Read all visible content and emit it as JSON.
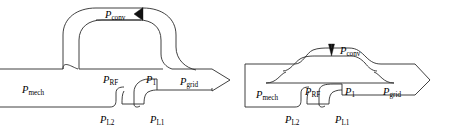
{
  "figure": {
    "kind": "power-flow-sankey-pair",
    "background_color": "#ffffff",
    "stroke_color": "#2b2b2b",
    "text_color": "#000000",
    "width": 474,
    "height": 135
  },
  "labels": {
    "p_conv_main": "P",
    "p_conv_sub": "conv",
    "p_rf_main": "P",
    "p_rf_sub": "RF",
    "p1_main": "P",
    "p1_sub": "1",
    "p_grid_main": "P",
    "p_grid_sub": "grid",
    "p_mech_main": "P",
    "p_mech_sub": "mech",
    "p_l1_main": "P",
    "p_l1_sub": "L1",
    "p_l2_main": "P",
    "p_l2_sub": "L2"
  },
  "left_diagram": {
    "name": "doubly-fed-power-flow",
    "labels": [
      "P conv",
      "P RF",
      "P 1",
      "P grid",
      "P mech",
      "P L1",
      "P L2"
    ],
    "loop_arrow_direction": "left",
    "loop_shape": "stadium-ring",
    "inlet_open": true,
    "outlet_arrow": "chevron-right"
  },
  "right_diagram": {
    "name": "brushless-doubly-fed-power-flow",
    "labels": [
      "P conv",
      "P RF",
      "P 1",
      "P grid",
      "P mech",
      "P L1",
      "P L2"
    ],
    "loop_arrow_direction": "down",
    "loop_shape": "flat-hump",
    "inlet_open": false,
    "outlet_arrow": "chevron-right"
  }
}
